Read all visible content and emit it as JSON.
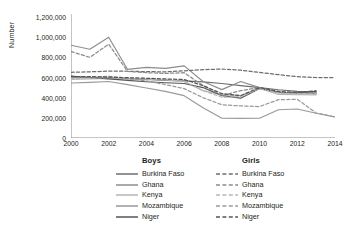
{
  "chart_data": {
    "type": "line",
    "title": "",
    "xlabel": "",
    "ylabel": "Number",
    "xlim": [
      2000,
      2014
    ],
    "ylim": [
      0,
      1200000
    ],
    "grid": false,
    "legend_position": "bottom",
    "x": [
      2000,
      2001,
      2002,
      2003,
      2004,
      2005,
      2006,
      2007,
      2008,
      2009,
      2010,
      2011,
      2012,
      2013,
      2014
    ],
    "xticklabels": [
      "2000",
      "2002",
      "2004",
      "2006",
      "2008",
      "2010",
      "2012",
      "2014"
    ],
    "xtickvalues": [
      2000,
      2002,
      2004,
      2006,
      2008,
      2010,
      2012,
      2014
    ],
    "yticklabels": [
      "0",
      "200,000",
      "400,000",
      "600,000",
      "800,000",
      "1,000,000",
      "1,200,000"
    ],
    "ytickvalues": [
      0,
      200000,
      400000,
      600000,
      800000,
      1000000,
      1200000
    ],
    "legend_groups": [
      {
        "name": "Boys",
        "style": "solid"
      },
      {
        "name": "Girls",
        "style": "dashed"
      }
    ],
    "countries": [
      "Burkina Faso",
      "Ghana",
      "Kenya",
      "Mozambique",
      "Niger"
    ],
    "series": [
      {
        "name": "Burkina Faso",
        "group": "Boys",
        "style": "solid",
        "color": "#6e6e6e",
        "values": [
          600000,
          597000,
          594000,
          588000,
          580000,
          572000,
          566000,
          556000,
          540000,
          520000,
          500000,
          478000,
          462000,
          455000,
          null
        ]
      },
      {
        "name": "Ghana",
        "group": "Boys",
        "style": "solid",
        "color": "#8c8c8c",
        "values": [
          920000,
          880000,
          1000000,
          680000,
          700000,
          690000,
          715000,
          560000,
          480000,
          560000,
          500000,
          452000,
          448000,
          440000,
          null
        ]
      },
      {
        "name": "Kenya",
        "group": "Boys",
        "style": "solid",
        "color": "#b5b5b5",
        "values": [
          580000,
          586000,
          590000,
          588000,
          584000,
          576000,
          560000,
          470000,
          430000,
          420000,
          492000,
          432000,
          430000,
          428000,
          null
        ]
      },
      {
        "name": "Mozambique",
        "group": "Boys",
        "style": "solid",
        "color": "#9a9a9a",
        "values": [
          545000,
          552000,
          560000,
          530000,
          496000,
          462000,
          420000,
          300000,
          196000,
          194000,
          196000,
          280000,
          288000,
          245000,
          210000
        ]
      },
      {
        "name": "Niger",
        "group": "Boys",
        "style": "solid",
        "color": "#555555",
        "values": [
          614000,
          600000,
          586000,
          572000,
          558000,
          548000,
          540000,
          500000,
          420000,
          395000,
          492000,
          452000,
          448000,
          462000,
          null
        ]
      },
      {
        "name": "Burkina Faso",
        "group": "Girls",
        "style": "dashed",
        "color": "#6e6e6e",
        "values": [
          652000,
          656000,
          664000,
          662000,
          658000,
          656000,
          666000,
          678000,
          684000,
          672000,
          650000,
          628000,
          608000,
          600000,
          600000
        ]
      },
      {
        "name": "Ghana",
        "group": "Girls",
        "style": "dashed",
        "color": "#8c8c8c",
        "values": [
          858000,
          800000,
          930000,
          660000,
          648000,
          640000,
          648000,
          520000,
          420000,
          470000,
          500000,
          452000,
          448000,
          440000,
          null
        ]
      },
      {
        "name": "Kenya",
        "group": "Girls",
        "style": "dashed",
        "color": "#b5b5b5",
        "values": [
          592000,
          594000,
          598000,
          596000,
          590000,
          580000,
          562000,
          470000,
          404000,
          410000,
          492000,
          444000,
          440000,
          438000,
          null
        ]
      },
      {
        "name": "Mozambique",
        "group": "Girls",
        "style": "dashed",
        "color": "#9a9a9a",
        "values": [
          600000,
          604000,
          612000,
          590000,
          566000,
          530000,
          490000,
          400000,
          330000,
          318000,
          312000,
          380000,
          384000,
          248000,
          208000
        ]
      },
      {
        "name": "Niger",
        "group": "Girls",
        "style": "dashed",
        "color": "#555555",
        "values": [
          610000,
          608000,
          604000,
          598000,
          592000,
          586000,
          580000,
          520000,
          440000,
          420000,
          500000,
          462000,
          452000,
          468000,
          null
        ]
      }
    ]
  },
  "axes": {
    "ylabel": "Number"
  },
  "legend": {
    "boys_header": "Boys",
    "girls_header": "Girls"
  }
}
